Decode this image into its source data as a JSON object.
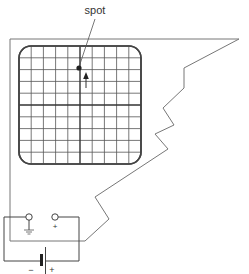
{
  "diagram": {
    "type": "oscilloscope-circuit",
    "labels": {
      "spot": "spot",
      "terminal_plus": "+",
      "battery_minus": "−",
      "battery_plus": "+"
    },
    "screen": {
      "divisions_x": 10,
      "divisions_y": 10,
      "spot_position": "above center, on vertical axis",
      "arrow_direction": "up"
    },
    "components": [
      {
        "name": "oscilloscope-screen"
      },
      {
        "name": "ground-terminal",
        "symbol": "ground-icon"
      },
      {
        "name": "positive-terminal",
        "symbol": "plus"
      },
      {
        "name": "battery",
        "symbol": "battery-icon"
      }
    ],
    "colors": {
      "line": "#555555",
      "grid": "#444444",
      "text": "#333333"
    }
  }
}
